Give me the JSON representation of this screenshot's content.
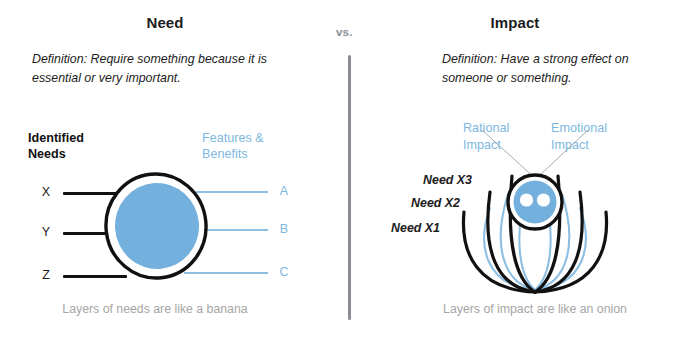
{
  "meta": {
    "comparison_label": "vs.",
    "accent_blue": "#74b0dd",
    "light_blue": "#8dbfe3",
    "label_blue": "#7db7e0",
    "ink": "#111111",
    "muted": "#a6a6a6"
  },
  "left_panel": {
    "title": "Need",
    "definition": "Definition: Require something because it is essential or very important.",
    "left_heading": "Identified\nNeeds",
    "right_heading": "Features &\nBenefits",
    "left_items": [
      {
        "label": "X"
      },
      {
        "label": "Y"
      },
      {
        "label": "Z"
      }
    ],
    "right_items": [
      {
        "label": "A"
      },
      {
        "label": "B"
      },
      {
        "label": "C"
      }
    ],
    "caption": "Layers of needs are\nlike a banana",
    "diagram": {
      "type": "concentric-circle",
      "outer_stroke": "#111111",
      "inner_fill": "#74b0dd",
      "ring_fill": "#ffffff"
    }
  },
  "right_panel": {
    "title": "Impact",
    "definition": "Definition: Have a strong effect on someone or something.",
    "need_labels": [
      {
        "label": "Need X3"
      },
      {
        "label": "Need X2"
      },
      {
        "label": "Need X1"
      }
    ],
    "impact_labels": [
      {
        "label": "Rational\nImpact"
      },
      {
        "label": "Emotional\nImpact"
      }
    ],
    "caption": "Layers of impact are\nlike an onion",
    "diagram": {
      "type": "onion-petals",
      "black_arcs": 3,
      "blue_arcs": 3,
      "core_fill": "#74b0dd",
      "core_stroke": "#111111",
      "core_dots": 2
    }
  }
}
